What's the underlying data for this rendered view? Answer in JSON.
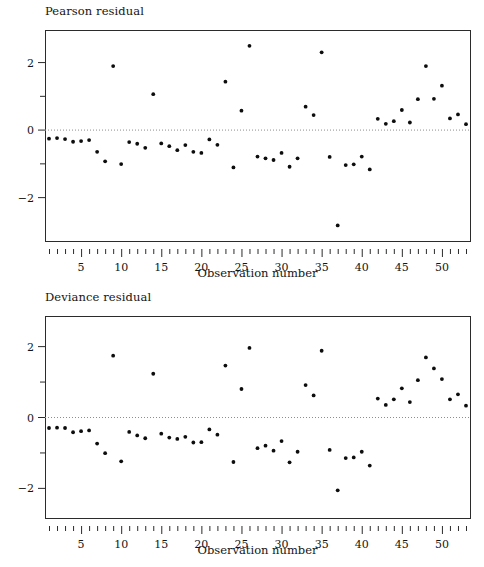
{
  "figure": {
    "background": "#ffffff",
    "point_color": "#0d0d0d",
    "axis_color": "#2b2b2b",
    "zeroline_color": "#8d8d8d"
  },
  "panels": {
    "pearson": {
      "title": "Pearson residual",
      "xlabel": "Observation number"
    },
    "deviance": {
      "title": "Deviance residual",
      "xlabel": "Observation number"
    }
  },
  "chart_data": [
    {
      "type": "scatter",
      "title": "Pearson residual",
      "xlabel": "Observation number",
      "ylabel": "Pearson residual",
      "xlim": [
        0.5,
        53.5
      ],
      "ylim": [
        -3.3,
        2.95
      ],
      "yticks": [
        -2,
        0,
        2
      ],
      "ytick_labels": [
        "−2",
        "0",
        "2"
      ],
      "xticks": [
        5,
        10,
        15,
        20,
        25,
        30,
        35,
        40,
        45,
        50
      ],
      "xtick_labels": [
        "5",
        "10",
        "15",
        "20",
        "25",
        "30",
        "35",
        "40",
        "45",
        "50"
      ],
      "minor_xticks_every": 1,
      "minor_xtick_range": [
        1,
        53
      ],
      "grid": false,
      "legend": "none",
      "zero_reference_line": 0,
      "x": [
        1,
        2,
        3,
        4,
        5,
        6,
        7,
        8,
        9,
        10,
        11,
        12,
        13,
        14,
        15,
        16,
        17,
        18,
        19,
        20,
        21,
        22,
        23,
        24,
        25,
        26,
        27,
        28,
        29,
        30,
        31,
        32,
        33,
        34,
        35,
        36,
        37,
        38,
        39,
        40,
        41,
        42,
        43,
        44,
        45,
        46,
        47,
        48,
        49,
        50,
        51,
        52,
        53
      ],
      "y": [
        -0.27,
        -0.25,
        -0.28,
        -0.36,
        -0.34,
        -0.31,
        -0.66,
        -0.94,
        1.88,
        -1.02,
        -0.37,
        -0.42,
        -0.54,
        1.05,
        -0.41,
        -0.49,
        -0.61,
        -0.46,
        -0.66,
        -0.69,
        -0.29,
        -0.45,
        1.42,
        -1.12,
        0.56,
        2.48,
        -0.8,
        -0.85,
        -0.9,
        -0.69,
        -1.1,
        -0.85,
        0.68,
        0.43,
        2.29,
        -0.81,
        -2.84,
        -1.05,
        -1.03,
        -0.8,
        -1.18,
        0.32,
        0.17,
        0.25,
        0.58,
        0.21,
        0.9,
        1.88,
        0.91,
        1.3,
        0.33,
        0.45,
        0.16
      ]
    },
    {
      "type": "scatter",
      "title": "Deviance residual",
      "xlabel": "Observation number",
      "ylabel": "Deviance residual",
      "xlim": [
        0.5,
        53.5
      ],
      "ylim": [
        -2.85,
        2.85
      ],
      "yticks": [
        -2,
        0,
        2
      ],
      "ytick_labels": [
        "−2",
        "0",
        "2"
      ],
      "xticks": [
        5,
        10,
        15,
        20,
        25,
        30,
        35,
        40,
        45,
        50
      ],
      "xtick_labels": [
        "5",
        "10",
        "15",
        "20",
        "25",
        "30",
        "35",
        "40",
        "45",
        "50"
      ],
      "minor_xticks_every": 1,
      "minor_xtick_range": [
        1,
        53
      ],
      "grid": false,
      "legend": "none",
      "zero_reference_line": 0,
      "x": [
        1,
        2,
        3,
        4,
        5,
        6,
        7,
        8,
        9,
        10,
        11,
        12,
        13,
        14,
        15,
        16,
        17,
        18,
        19,
        20,
        21,
        22,
        23,
        24,
        25,
        26,
        27,
        28,
        29,
        30,
        31,
        32,
        33,
        34,
        35,
        36,
        37,
        38,
        39,
        40,
        41,
        42,
        43,
        44,
        45,
        46,
        47,
        48,
        49,
        50,
        51,
        52,
        53
      ],
      "y": [
        -0.31,
        -0.3,
        -0.31,
        -0.43,
        -0.4,
        -0.38,
        -0.75,
        -1.02,
        1.73,
        -1.25,
        -0.42,
        -0.52,
        -0.6,
        1.22,
        -0.47,
        -0.58,
        -0.62,
        -0.56,
        -0.72,
        -0.71,
        -0.35,
        -0.5,
        1.45,
        -1.27,
        0.79,
        1.95,
        -0.88,
        -0.81,
        -0.95,
        -0.68,
        -1.28,
        -0.98,
        0.9,
        0.61,
        1.87,
        -0.93,
        -2.07,
        -1.16,
        -1.14,
        -0.98,
        -1.37,
        0.52,
        0.34,
        0.5,
        0.81,
        0.42,
        1.04,
        1.68,
        1.37,
        1.07,
        0.5,
        0.64,
        0.32
      ]
    }
  ]
}
